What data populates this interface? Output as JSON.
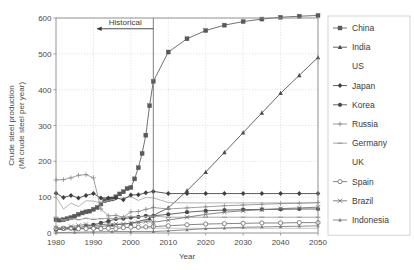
{
  "chart_data": {
    "type": "line",
    "title": "",
    "xlabel": "Year",
    "ylabel": "Crude steel production (Mt crude steel per year)",
    "ylabel_line1": "Crude steel production",
    "ylabel_line2": "(Mt crude steel per year)",
    "xlim": [
      1980,
      2050
    ],
    "ylim": [
      0,
      600
    ],
    "xticks": [
      1980,
      1990,
      2000,
      2010,
      2020,
      2030,
      2040,
      2050
    ],
    "yticks": [
      0,
      100,
      200,
      300,
      400,
      500,
      600
    ],
    "grid": true,
    "legend_position": "right",
    "annotations": [
      {
        "text": "Historical",
        "type": "arrow-label",
        "x_end": 2006,
        "x_start": 1991,
        "y": 570
      }
    ],
    "divider_year": 2006,
    "series": [
      {
        "name": "China",
        "marker": "filled-square",
        "color": "#595959",
        "x": [
          1980,
          1981,
          1982,
          1983,
          1984,
          1985,
          1986,
          1987,
          1988,
          1989,
          1990,
          1991,
          1992,
          1993,
          1994,
          1995,
          1996,
          1997,
          1998,
          1999,
          2000,
          2001,
          2002,
          2003,
          2004,
          2005,
          2006,
          2010,
          2015,
          2020,
          2025,
          2030,
          2035,
          2040,
          2045,
          2050
        ],
        "values": [
          37,
          36,
          37,
          40,
          43,
          47,
          52,
          56,
          59,
          61,
          66,
          71,
          81,
          90,
          93,
          95,
          101,
          109,
          115,
          124,
          127,
          151,
          182,
          222,
          273,
          355,
          423,
          505,
          542,
          565,
          580,
          590,
          597,
          602,
          605,
          607
        ]
      },
      {
        "name": "India",
        "marker": "filled-triangle",
        "color": "#4a4a4a",
        "x": [
          1980,
          1985,
          1990,
          1995,
          2000,
          2005,
          2006,
          2010,
          2015,
          2020,
          2025,
          2030,
          2035,
          2040,
          2045,
          2050
        ],
        "values": [
          10,
          12,
          15,
          22,
          27,
          40,
          49,
          70,
          118,
          170,
          225,
          280,
          335,
          390,
          440,
          490
        ]
      },
      {
        "name": "US",
        "marker": "none",
        "color": "#a8a8a8",
        "x": [
          1980,
          1982,
          1984,
          1986,
          1988,
          1990,
          1992,
          1994,
          1996,
          1998,
          2000,
          2002,
          2004,
          2006,
          2010,
          2015,
          2020,
          2025,
          2030,
          2035,
          2040,
          2045,
          2050
        ],
        "values": [
          101,
          67,
          83,
          74,
          90,
          89,
          84,
          91,
          95,
          98,
          101,
          91,
          99,
          98,
          85,
          84,
          84,
          84,
          84,
          84,
          84,
          84,
          84
        ]
      },
      {
        "name": "Japan",
        "marker": "filled-diamond",
        "color": "#3f3f3f",
        "x": [
          1980,
          1982,
          1984,
          1986,
          1988,
          1990,
          1992,
          1994,
          1996,
          1998,
          2000,
          2002,
          2004,
          2006,
          2010,
          2015,
          2020,
          2025,
          2030,
          2035,
          2040,
          2045,
          2050
        ],
        "values": [
          111,
          99,
          105,
          98,
          105,
          110,
          98,
          98,
          98,
          93,
          106,
          107,
          112,
          116,
          110,
          110,
          110,
          110,
          110,
          110,
          110,
          110,
          110
        ]
      },
      {
        "name": "Korea",
        "marker": "filled-circle",
        "color": "#4a4a4a",
        "x": [
          1980,
          1982,
          1984,
          1986,
          1988,
          1990,
          1992,
          1994,
          1996,
          1998,
          2000,
          2002,
          2004,
          2006,
          2010,
          2015,
          2020,
          2025,
          2030,
          2035,
          2040,
          2045,
          2050
        ],
        "values": [
          9,
          12,
          13,
          15,
          19,
          23,
          28,
          33,
          39,
          40,
          43,
          45,
          48,
          48,
          52,
          58,
          62,
          64,
          65,
          66,
          66,
          67,
          67
        ]
      },
      {
        "name": "Russia",
        "marker": "plus",
        "color": "#8f8f8f",
        "x": [
          1980,
          1982,
          1984,
          1986,
          1988,
          1990,
          1992,
          1994,
          1996,
          1998,
          2000,
          2002,
          2004,
          2006,
          2010,
          2015,
          2020,
          2025,
          2030,
          2035,
          2040,
          2045,
          2050
        ],
        "values": [
          148,
          149,
          154,
          161,
          163,
          154,
          67,
          48,
          49,
          44,
          59,
          60,
          66,
          71,
          67,
          70,
          73,
          76,
          78,
          80,
          82,
          83,
          85
        ]
      },
      {
        "name": "Germany",
        "marker": "dash",
        "color": "#9a9a9a",
        "x": [
          1980,
          1982,
          1984,
          1986,
          1988,
          1990,
          1992,
          1994,
          1996,
          1998,
          2000,
          2002,
          2004,
          2006,
          2010,
          2015,
          2020,
          2025,
          2030,
          2035,
          2040,
          2045,
          2050
        ],
        "values": [
          44,
          36,
          40,
          37,
          41,
          38,
          40,
          41,
          40,
          44,
          46,
          45,
          46,
          47,
          44,
          44,
          44,
          44,
          44,
          44,
          44,
          44,
          44
        ]
      },
      {
        "name": "UK",
        "marker": "none",
        "color": "#bdbdbd",
        "x": [
          1980,
          1985,
          1990,
          1995,
          2000,
          2006,
          2010,
          2020,
          2030,
          2040,
          2050
        ],
        "values": [
          11,
          16,
          18,
          18,
          15,
          14,
          13,
          13,
          13,
          13,
          13
        ]
      },
      {
        "name": "Spain",
        "marker": "open-circle",
        "color": "#707070",
        "x": [
          1980,
          1982,
          1984,
          1986,
          1988,
          1990,
          1992,
          1994,
          1996,
          1998,
          2000,
          2002,
          2004,
          2006,
          2010,
          2015,
          2020,
          2025,
          2030,
          2035,
          2040,
          2045,
          2050
        ],
        "values": [
          13,
          13,
          14,
          12,
          12,
          13,
          12,
          13,
          12,
          15,
          16,
          16,
          17,
          18,
          20,
          23,
          25,
          26,
          27,
          28,
          28,
          29,
          29
        ]
      },
      {
        "name": "Brazil",
        "marker": "cross",
        "color": "#6f6f6f",
        "x": [
          1980,
          1982,
          1984,
          1986,
          1988,
          1990,
          1992,
          1994,
          1996,
          1998,
          2000,
          2002,
          2004,
          2006,
          2010,
          2015,
          2020,
          2025,
          2030,
          2035,
          2040,
          2045,
          2050
        ],
        "values": [
          15,
          13,
          18,
          21,
          24,
          20,
          23,
          25,
          25,
          25,
          27,
          29,
          32,
          30,
          36,
          44,
          52,
          58,
          62,
          65,
          68,
          70,
          72
        ]
      },
      {
        "name": "Indonesia",
        "marker": "small-triangle",
        "color": "#7a7a7a",
        "x": [
          1980,
          1985,
          1990,
          1995,
          2000,
          2006,
          2010,
          2015,
          2020,
          2025,
          2030,
          2035,
          2040,
          2045,
          2050
        ],
        "values": [
          1,
          2,
          3,
          4,
          4,
          4,
          6,
          9,
          12,
          14,
          16,
          17,
          18,
          19,
          20
        ]
      }
    ]
  },
  "legend": {
    "items": [
      {
        "label": "China"
      },
      {
        "label": "India"
      },
      {
        "label": "US"
      },
      {
        "label": "Japan"
      },
      {
        "label": "Korea"
      },
      {
        "label": "Russia"
      },
      {
        "label": "Germany"
      },
      {
        "label": "UK"
      },
      {
        "label": "Spain"
      },
      {
        "label": "Brazil"
      },
      {
        "label": "Indonesia"
      }
    ]
  }
}
